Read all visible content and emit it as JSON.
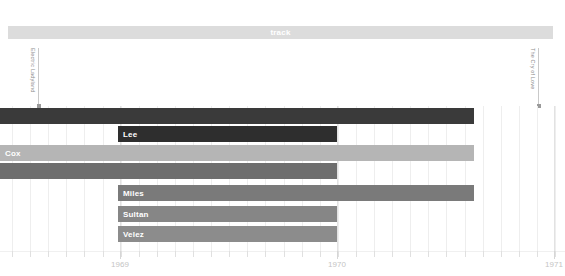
{
  "header": {
    "track_label": "track"
  },
  "annotations": [
    {
      "name": "electric-ladyland",
      "text": "Electric Ladyland",
      "x": 38
    },
    {
      "name": "the-cry-of-love",
      "text": "The Cry of Love",
      "x": 538
    }
  ],
  "axis": {
    "ticks": [
      {
        "label": "1969",
        "x": 120,
        "major": true
      },
      {
        "label": "1970",
        "x": 337,
        "major": true
      },
      {
        "label": "1971",
        "x": 554,
        "major": true
      }
    ],
    "minor_spacing_px": 18.1,
    "minor_start_x": 12,
    "minor_count": 31
  },
  "chart_data": {
    "type": "bar",
    "orientation": "horizontal",
    "title": "track",
    "xlabel": "",
    "ylabel": "",
    "x_tick_labels": [
      "1969",
      "1970",
      "1971"
    ],
    "xlim": [
      "1968-09",
      "1971-01"
    ],
    "grid": true,
    "legend": false,
    "annotations": [
      "Electric Ladyland",
      "The Cry of Love"
    ],
    "categories": [
      "",
      "Lee",
      "Cox",
      "",
      "Miles",
      "Sultan",
      "Velez"
    ],
    "bars": [
      {
        "label": "",
        "x": 0,
        "width": 474,
        "y": 108,
        "height": 16,
        "color": "#3a3a3a",
        "open_left": true,
        "show_label": false
      },
      {
        "label": "Lee",
        "x": 118,
        "width": 219,
        "y": 126,
        "height": 16,
        "color": "#2e2e2e",
        "open_left": false,
        "show_label": true
      },
      {
        "label": "Cox",
        "x": 0,
        "width": 474,
        "y": 145,
        "height": 16,
        "color": "#b5b5b5",
        "open_left": true,
        "show_label": true
      },
      {
        "label": "",
        "x": 0,
        "width": 337,
        "y": 163,
        "height": 16,
        "color": "#6e6e6e",
        "open_left": true,
        "show_label": false
      },
      {
        "label": "Miles",
        "x": 118,
        "width": 356,
        "y": 185,
        "height": 16,
        "color": "#7a7a7a",
        "open_left": false,
        "show_label": true
      },
      {
        "label": "Sultan",
        "x": 118,
        "width": 219,
        "y": 206,
        "height": 16,
        "color": "#868686",
        "open_left": false,
        "show_label": true
      },
      {
        "label": "Velez",
        "x": 118,
        "width": 219,
        "y": 226,
        "height": 16,
        "color": "#8c8c8c",
        "open_left": false,
        "show_label": true
      }
    ]
  },
  "colors": {
    "header_bar": "#dcdcdc",
    "grid_minor": "#eeeeee",
    "grid_year": "#e2e2e2",
    "axis_text": "#c4c4c4",
    "annotation_text": "#8d8d8d",
    "background": "#ffffff"
  }
}
